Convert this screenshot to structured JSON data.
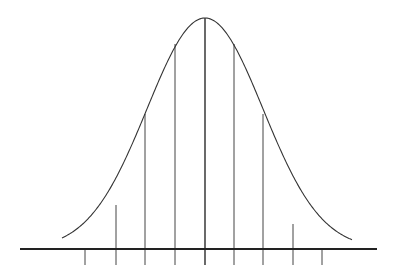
{
  "chart_data": {
    "type": "line",
    "title": "",
    "xlabel": "",
    "ylabel": "",
    "grid": false,
    "legend": null,
    "x_ticks": [
      -4,
      -3,
      -2,
      -1,
      0,
      1,
      2,
      3,
      4
    ],
    "tick_labels": [],
    "vertical_lines_relative_height": [
      0.0,
      0.17,
      0.58,
      0.89,
      1.0,
      0.89,
      0.58,
      0.11,
      0.0
    ],
    "curve": "gaussian",
    "colors": {
      "curve": "#333333",
      "lines": "#444444",
      "axis": "#222222",
      "background": "#ffffff"
    }
  },
  "geometry": {
    "baseline_y": 249,
    "axis_x1": 20,
    "axis_x2": 377,
    "center_x": 205,
    "peak_y": 18,
    "tick_bottom_y": 265,
    "tick_x": [
      85,
      116,
      145,
      175,
      205,
      234,
      263,
      293,
      322
    ],
    "line_top_y": [
      249,
      205,
      114,
      44,
      18,
      44,
      114,
      224,
      249
    ]
  }
}
